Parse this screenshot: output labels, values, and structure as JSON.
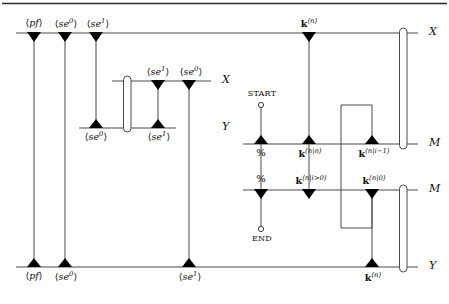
{
  "figure": {
    "type": "message-sequence-chart",
    "title_present": false,
    "axis_labels": {
      "top_x": "X",
      "mid_x": "X",
      "mid_y": "Y",
      "upper_m": "M",
      "lower_m": "M",
      "bottom_y": "Y"
    },
    "colors": {
      "line": "#4a4a4a",
      "marker": "#000000",
      "text": "#0d0d0d",
      "background": "#ffffff",
      "rule": "#2a2a2a"
    }
  },
  "top_axis": {
    "name": "X",
    "label": "X",
    "events": [
      {
        "id": "pf-top",
        "label": "⟨pf⟩",
        "base": "pf",
        "sup": "",
        "position": "above"
      },
      {
        "id": "se0-top",
        "label": "⟨se0⟩",
        "base": "se",
        "sup": "0",
        "position": "above"
      },
      {
        "id": "se1-top",
        "label": "⟨se1⟩",
        "base": "se",
        "sup": "1",
        "position": "above"
      },
      {
        "id": "kn-top",
        "label": "k(n)",
        "base": "k",
        "sup": "(n)",
        "position": "above"
      }
    ]
  },
  "mid_block": {
    "x_axis": {
      "name": "X",
      "label": "X",
      "events": [
        {
          "id": "se1-midx",
          "label": "⟨se1⟩",
          "base": "se",
          "sup": "1",
          "position": "above"
        },
        {
          "id": "se0-midx",
          "label": "⟨se0⟩",
          "base": "se",
          "sup": "0",
          "position": "above"
        }
      ]
    },
    "y_axis": {
      "name": "Y",
      "label": "Y",
      "events": [
        {
          "id": "se0-midy",
          "label": "⟨se0⟩",
          "base": "se",
          "sup": "0",
          "position": "below"
        },
        {
          "id": "se1-midy",
          "label": "⟨se1⟩",
          "base": "se",
          "sup": "1",
          "position": "below"
        }
      ]
    }
  },
  "upper_m_axis": {
    "name": "M",
    "label": "M",
    "start_marker": "START",
    "events": [
      {
        "id": "pct-upper",
        "label": "%",
        "base": "%",
        "sup": "",
        "position": "below"
      },
      {
        "id": "knn-upper",
        "label": "k(n|n)",
        "base": "k",
        "sup": "(n|n)",
        "position": "below"
      },
      {
        "id": "knim1-upper",
        "label": "k(n|i-1)",
        "base": "k",
        "sup": "(n|i−1)",
        "position": "below"
      }
    ]
  },
  "lower_m_axis": {
    "name": "M",
    "label": "M",
    "end_marker": "END",
    "events": [
      {
        "id": "pct-lower",
        "label": "%",
        "base": "%",
        "sup": "",
        "position": "above"
      },
      {
        "id": "knig0",
        "label": "k(n|i>0)",
        "base": "k",
        "sup": "(n|i>0)",
        "position": "above"
      },
      {
        "id": "kn0",
        "label": "k(n|0)",
        "base": "k",
        "sup": "(n|0)",
        "position": "above"
      }
    ]
  },
  "bottom_axis": {
    "name": "Y",
    "label": "Y",
    "events": [
      {
        "id": "pf-bot",
        "label": "⟨pf⟩",
        "base": "pf",
        "sup": "",
        "position": "below"
      },
      {
        "id": "se0-bot",
        "label": "⟨se0⟩",
        "base": "se",
        "sup": "0",
        "position": "below"
      },
      {
        "id": "se1-bot",
        "label": "⟨se1⟩",
        "base": "se",
        "sup": "1",
        "position": "below"
      },
      {
        "id": "kn-bot",
        "label": "k(n)",
        "base": "k",
        "sup": "(n)",
        "position": "below"
      }
    ]
  },
  "text": {
    "angle_open": "⟨",
    "angle_close": "⟩",
    "pf": "pf",
    "se": "se",
    "sup_zero": "0",
    "sup_one": "1",
    "k": "k",
    "sup_n": "(n)",
    "sup_n_n": "(n|n)",
    "sup_n_im1": "(n|i−1)",
    "sup_n_ig0": "(n|i>0)",
    "sup_n_0": "(n|0)",
    "percent": "%",
    "start": "START",
    "end": "END",
    "axis_X": "X",
    "axis_Y": "Y",
    "axis_M": "M"
  }
}
